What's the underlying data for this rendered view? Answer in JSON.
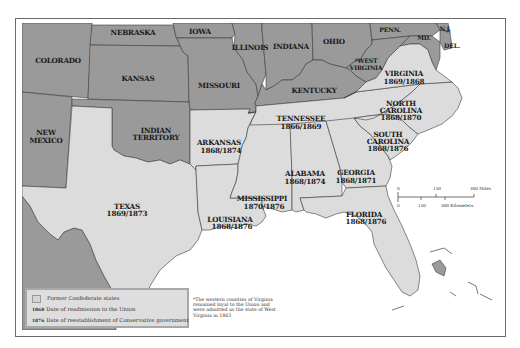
{
  "map": {
    "title": "",
    "colors": {
      "confederate_fill": "#dcdcdc",
      "union_fill": "#9a9a9a",
      "water": "#ffffff",
      "border": "#3a3a3a"
    },
    "states": {
      "colorado": {
        "name": "COLORADO"
      },
      "nebraska": {
        "name": "NEBRASKA"
      },
      "iowa": {
        "name": "IOWA"
      },
      "kansas": {
        "name": "KANSAS"
      },
      "missouri": {
        "name": "MISSOURI"
      },
      "illinois": {
        "name": "ILLINOIS"
      },
      "indiana": {
        "name": "INDIANA"
      },
      "ohio": {
        "name": "OHIO"
      },
      "penn": {
        "name": "PENN."
      },
      "nj": {
        "name": "N.J."
      },
      "md": {
        "name": "MD."
      },
      "del": {
        "name": "DEL."
      },
      "west_virginia": {
        "name_line1": "*WEST",
        "name_line2": "VIRGINIA"
      },
      "kentucky": {
        "name": "KENTUCKY"
      },
      "new_mexico": {
        "name_line1": "NEW",
        "name_line2": "MEXICO"
      },
      "indian_territory": {
        "name_line1": "INDIAN",
        "name_line2": "TERRITORY"
      },
      "virginia": {
        "name": "VIRGINIA",
        "dates": "1869/1868"
      },
      "north_carolina": {
        "name_line1": "NORTH",
        "name_line2": "CAROLINA",
        "dates": "1868/1870"
      },
      "tennessee": {
        "name": "TENNESSEE",
        "dates": "1866/1869"
      },
      "south_carolina": {
        "name_line1": "SOUTH",
        "name_line2": "CAROLINA",
        "dates": "1868/1876"
      },
      "arkansas": {
        "name": "ARKANSAS",
        "dates": "1868/1874"
      },
      "alabama": {
        "name": "ALABAMA",
        "dates": "1868/1874"
      },
      "georgia": {
        "name": "GEORGIA",
        "dates": "1868/1871"
      },
      "mississippi": {
        "name": "MISSISSIPPI",
        "dates": "1870/1876"
      },
      "texas": {
        "name": "TEXAS",
        "dates": "1869/1873"
      },
      "louisiana": {
        "name": "LOUISIANA",
        "dates": "1868/1876"
      },
      "florida": {
        "name": "FLORIDA",
        "dates": "1868/1876"
      }
    },
    "scale_bar": {
      "miles": [
        "0",
        "150",
        "300 Miles"
      ],
      "kilometers": [
        "0",
        "150",
        "300 Kilometers"
      ]
    },
    "legend": {
      "swatch_label": "Former Confederate states",
      "key1": "1868",
      "key1_label": "Date of readmission to the Union",
      "key2": "1876",
      "key2_label": "Date of reestablishment of Conservative government"
    },
    "footnote": "*The western counties of Virginia remained loyal to the Union and were admitted as the state of West Virginia in 1863"
  }
}
